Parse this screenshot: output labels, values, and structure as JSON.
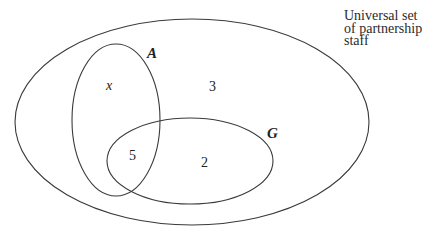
{
  "diagram": {
    "type": "venn",
    "universe": {
      "caption_lines": [
        "Universal set",
        "of partnership",
        "staff"
      ]
    },
    "sets": [
      {
        "id": "A",
        "label": "A"
      },
      {
        "id": "G",
        "label": "G"
      }
    ],
    "regions": {
      "A_only": "x",
      "A_and_G": "5",
      "G_only": "2",
      "neither": "3"
    }
  }
}
